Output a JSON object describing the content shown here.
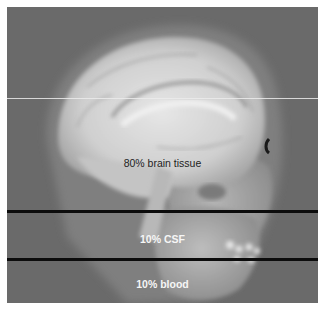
{
  "figure": {
    "regions": [
      {
        "id": "brain",
        "label": "80% brain tissue"
      },
      {
        "id": "csf",
        "label": "10% CSF"
      },
      {
        "id": "blood",
        "label": "10% blood"
      }
    ],
    "colors": {
      "background": "#6a6a6a",
      "tissue_light": "#d8d8d8",
      "divider": "#0c0c0c",
      "label_dark": "#1e1e1e",
      "label_light": "#f6f6f6"
    }
  }
}
